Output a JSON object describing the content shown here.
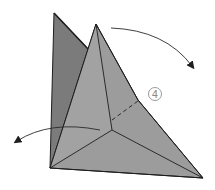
{
  "diagram": {
    "type": "origami-fold-step",
    "step_number": "4",
    "colors": {
      "background": "#ffffff",
      "back_flap": "#7d7d7d",
      "front_face": "#9a9a9a",
      "front_face_light": "#a3a3a3",
      "outline": "#1e1e1e",
      "step_circle": "#9a9a9a",
      "arrow": "#2a2a2a"
    },
    "elements": [
      {
        "name": "back-flap",
        "description": "darker grey flap behind the model"
      },
      {
        "name": "front-face",
        "description": "front grey triangular model with crease lines"
      },
      {
        "name": "dashed-fold-line",
        "description": "valley fold indicator"
      },
      {
        "name": "fold-arrow-right",
        "description": "curved arrow arcing to the lower right"
      },
      {
        "name": "fold-arrow-left",
        "description": "curved arrow arcing to the lower left"
      },
      {
        "name": "step-marker",
        "description": "circled step number"
      }
    ]
  }
}
